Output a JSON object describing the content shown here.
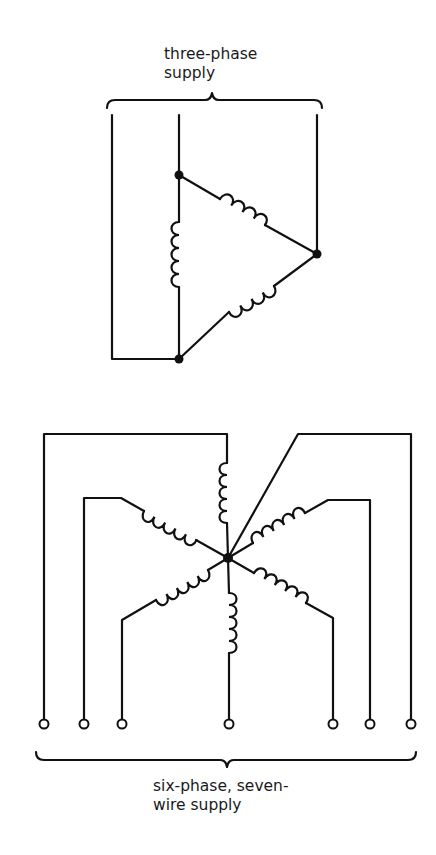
{
  "diagram": {
    "three_phase": {
      "label_line1": "three-phase",
      "label_line2": "supply",
      "connection": "delta",
      "windings": 3,
      "supply_lines": 3
    },
    "six_phase": {
      "label_line1": "six-phase, seven-",
      "label_line2": "wire supply",
      "connection": "star",
      "windings": 6,
      "terminals": 7
    },
    "colors": {
      "line": "#111111",
      "background": "#ffffff"
    }
  }
}
